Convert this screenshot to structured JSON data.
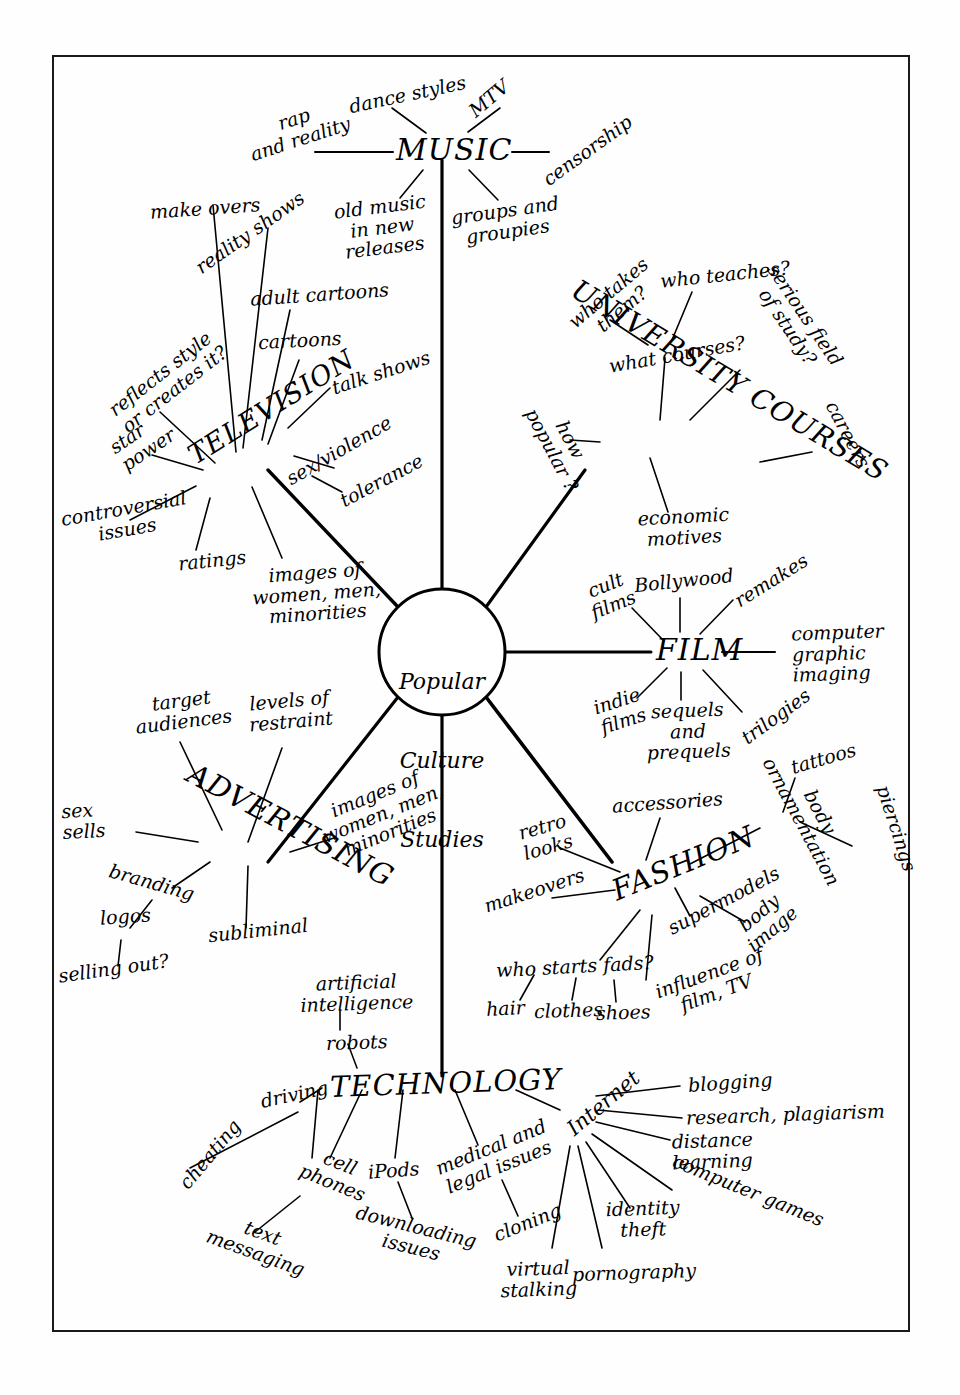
{
  "diagram": {
    "center": {
      "label": "Popular\nCulture\nStudies",
      "line1": "Popular",
      "line2": "Culture",
      "line3": "Studies"
    },
    "branches": [
      {
        "id": "music",
        "label": "MUSIC",
        "children": [
          "rap\nand reality",
          "dance styles",
          "MTV",
          "censorship",
          "old music\nin new\nreleases",
          "groups and\ngroupies"
        ]
      },
      {
        "id": "television",
        "label": "TELEVISION",
        "children": [
          "make overs",
          "reality shows",
          "adult cartoons",
          "cartoons",
          "talk shows",
          "reflects style\nor creates it?",
          "star\npower",
          "sex/violence",
          "tolerance",
          "controversial\nissues",
          "ratings",
          "images of\nwomen, men,\nminorities"
        ]
      },
      {
        "id": "university-courses",
        "label": "UNIVERSITY COURSES",
        "children": [
          "who takes\nthem?",
          "who teaches?",
          "what courses?",
          "serious field\nof study?",
          "careers",
          "how\npopular ?",
          "economic\nmotives"
        ]
      },
      {
        "id": "film",
        "label": "FILM",
        "children": [
          "cult\nfilms",
          "Bollywood",
          "remakes",
          "computer\ngraphic\nimaging",
          "indie\nfilms",
          "sequels\nand\nprequels",
          "trilogies"
        ]
      },
      {
        "id": "fashion",
        "label": "FASHION",
        "children": [
          "accessories",
          "retro\nlooks",
          "makeovers",
          "supermodels",
          "body\nornamentation",
          "tattoos",
          "piercings",
          "body\nimage",
          "who starts fads?",
          "hair",
          "clothes",
          "shoes",
          "influence of\nfilm, TV"
        ]
      },
      {
        "id": "advertising",
        "label": "ADVERTISING",
        "children": [
          "target\naudiences",
          "levels of\nrestraint",
          "sex\nsells",
          "branding",
          "logos",
          "selling out?",
          "subliminal",
          "images of\nwomen, men,\nminorities"
        ]
      },
      {
        "id": "technology",
        "label": "TECHNOLOGY",
        "children": [
          "artificial\nintelligence",
          "robots",
          "driving",
          "cheating",
          "cell\nphones",
          "text\nmessaging",
          "iPods",
          "downloading\nissues",
          "medical and\nlegal issues",
          "cloning"
        ],
        "subbranches": [
          {
            "id": "internet",
            "label": "Internet",
            "children": [
              "blogging",
              "research, plagiarism",
              "distance\nlearning",
              "computer games",
              "identity\ntheft",
              "pornography",
              "virtual\nstalking"
            ]
          }
        ]
      }
    ],
    "labels": {
      "music": "MUSIC",
      "television": "TELEVISION",
      "university_courses": "UNIVERSITY COURSES",
      "film": "FILM",
      "fashion": "FASHION",
      "advertising": "ADVERTISING",
      "technology": "TECHNOLOGY",
      "internet": "Internet",
      "rap_and_reality": "rap\nand reality",
      "dance_styles": "dance styles",
      "mtv": "MTV",
      "censorship": "censorship",
      "old_music": "old music\nin new\nreleases",
      "groups_groupies": "groups and\ngroupies",
      "make_overs": "make overs",
      "reality_shows": "reality shows",
      "adult_cartoons": "adult cartoons",
      "cartoons": "cartoons",
      "talk_shows": "talk shows",
      "reflects_style": "reflects style\nor creates it?",
      "star_power": "star\npower",
      "sex_violence": "sex/violence",
      "tolerance": "tolerance",
      "controversial_issues": "controversial\nissues",
      "ratings": "ratings",
      "images_tv": "images of\nwomen, men,\nminorities",
      "who_takes_them": "who takes\nthem?",
      "who_teaches": "who teaches?",
      "what_courses": "what courses?",
      "serious_field": "serious field\nof study?",
      "careers": "careers",
      "how_popular": "how\npopular ?",
      "economic_motives": "economic\nmotives",
      "cult_films": "cult\nfilms",
      "bollywood": "Bollywood",
      "remakes": "remakes",
      "computer_graphic": "computer\ngraphic\nimaging",
      "indie_films": "indie\nfilms",
      "sequels_prequels": "sequels\nand\nprequels",
      "trilogies": "trilogies",
      "accessories": "accessories",
      "retro_looks": "retro\nlooks",
      "makeovers": "makeovers",
      "supermodels": "supermodels",
      "body_ornamentation": "body\nornamentation",
      "tattoos": "tattoos",
      "piercings": "piercings",
      "body_image": "body\nimage",
      "who_starts_fads": "who starts fads?",
      "hair": "hair",
      "clothes": "clothes",
      "shoes": "shoes",
      "influence_film_tv": "influence of\nfilm, TV",
      "target_audiences": "target\naudiences",
      "levels_of_restraint": "levels of\nrestraint",
      "sex_sells": "sex\nsells",
      "branding": "branding",
      "logos": "logos",
      "selling_out": "selling out?",
      "subliminal": "subliminal",
      "images_ad": "images of\nwomen, men,\nminorities",
      "artificial_intelligence": "artificial\nintelligence",
      "robots": "robots",
      "driving": "driving",
      "cheating": "cheating",
      "cell_phones": "cell\nphones",
      "text_messaging": "text\nmessaging",
      "ipods": "iPods",
      "downloading_issues": "downloading\nissues",
      "medical_legal": "medical and\nlegal issues",
      "cloning": "cloning",
      "blogging": "blogging",
      "research_plagiarism": "research, plagiarism",
      "distance_learning": "distance\nlearning",
      "computer_games": "computer games",
      "identity_theft": "identity\ntheft",
      "pornography": "pornography",
      "virtual_stalking": "virtual\nstalking"
    },
    "colors": {
      "ink": "#000000",
      "background": "#ffffff",
      "border": "#1a1a1a"
    }
  }
}
